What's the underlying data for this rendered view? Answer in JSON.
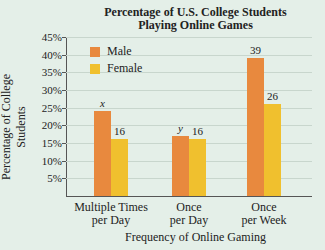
{
  "chart_data": {
    "type": "bar",
    "title": "Percentage of U.S. College Students Playing Online Games",
    "title_lines": [
      "Percentage of U.S. College Students",
      "Playing Online Games"
    ],
    "xlabel": "Frequency of Online Gaming",
    "ylabel": "Percentage of College Students",
    "categories": [
      "Multiple Times per Day",
      "Once per Day",
      "Once per Week"
    ],
    "category_lines": [
      [
        "Multiple Times",
        "per Day"
      ],
      [
        "Once",
        "per Day"
      ],
      [
        "Once",
        "per Week"
      ]
    ],
    "series": [
      {
        "name": "Male",
        "color": "#e8893e",
        "values": [
          24,
          17,
          39
        ],
        "labels": [
          "x",
          "y",
          "39"
        ]
      },
      {
        "name": "Female",
        "color": "#f0c02e",
        "values": [
          16,
          16,
          26
        ],
        "labels": [
          "16",
          "16",
          "26"
        ]
      }
    ],
    "ylim": [
      0,
      45
    ],
    "yticks": [
      "5%",
      "10%",
      "15%",
      "20%",
      "25%",
      "30%",
      "35%",
      "40%",
      "45%"
    ],
    "grid": true,
    "legend_position": "top-left"
  }
}
